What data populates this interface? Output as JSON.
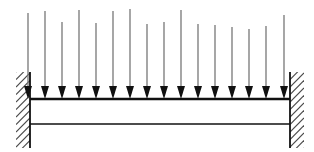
{
  "figure": {
    "width": 314,
    "height": 152,
    "background_color": "#ffffff"
  },
  "colors": {
    "arrow_head": "#111111",
    "arrow_shaft": "#777777",
    "beam_line": "#111111",
    "wall_outline": "#111111",
    "wall_hatch": "#4a4a4a",
    "background": "#ffffff"
  },
  "beam": {
    "label": "beam",
    "x_start": 30,
    "x_end": 290,
    "top_y": 99,
    "bottom_y": 124,
    "top_line_width": 2.4,
    "bottom_line_width": 1.5
  },
  "supports": [
    {
      "name": "left-fixed-support",
      "label": "Fixed support (left)",
      "type": "fixed",
      "side": "left",
      "wall_line_x": 30,
      "hatch_x": 16,
      "hatch_width": 14,
      "top_y": 72,
      "bottom_y": 148,
      "hatch_count": 11
    },
    {
      "name": "right-fixed-support",
      "label": "Fixed support (right)",
      "type": "fixed",
      "side": "right",
      "wall_line_x": 290,
      "hatch_x": 290,
      "hatch_width": 14,
      "top_y": 72,
      "bottom_y": 148,
      "hatch_count": 11
    }
  ],
  "load": {
    "name": "uniformly-distributed-load",
    "label": "Uniformly distributed load",
    "direction": "down",
    "arrow_count": 16,
    "arrow_spacing": 17.1,
    "head_width": 8,
    "head_height": 13,
    "shaft_width": 1.3,
    "tip_y": 99,
    "arrows": [
      {
        "x": 28,
        "top_y": 13
      },
      {
        "x": 45,
        "top_y": 11
      },
      {
        "x": 62,
        "top_y": 22
      },
      {
        "x": 79,
        "top_y": 10
      },
      {
        "x": 96,
        "top_y": 23
      },
      {
        "x": 113,
        "top_y": 11
      },
      {
        "x": 130,
        "top_y": 9
      },
      {
        "x": 147,
        "top_y": 24
      },
      {
        "x": 164,
        "top_y": 22
      },
      {
        "x": 181,
        "top_y": 10
      },
      {
        "x": 198,
        "top_y": 24
      },
      {
        "x": 215,
        "top_y": 25
      },
      {
        "x": 232,
        "top_y": 27
      },
      {
        "x": 249,
        "top_y": 29
      },
      {
        "x": 266,
        "top_y": 26
      },
      {
        "x": 284,
        "top_y": 15
      }
    ]
  },
  "chart_data": {
    "type": "diagram",
    "elements": [
      "left fixed (built-in) wall support with diagonal hatching",
      "right fixed (built-in) wall support with diagonal hatching",
      "horizontal beam drawn as two parallel lines",
      "16 equally spaced downward load arrows on the beam top surface"
    ]
  }
}
